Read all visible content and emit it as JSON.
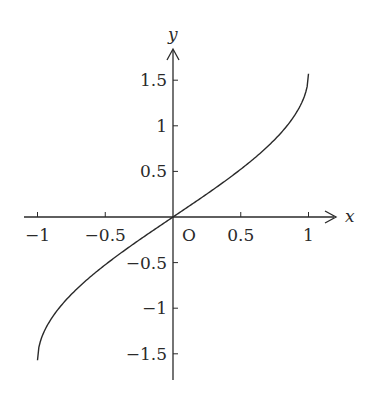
{
  "chart_data": {
    "type": "line",
    "title": "",
    "function": "y = arcsin(x)",
    "xlabel": "x",
    "ylabel": "y",
    "origin_label": "O",
    "xlim": [
      -1.1,
      1.2
    ],
    "ylim": [
      -1.8,
      1.8
    ],
    "grid": false,
    "legend": null,
    "x_ticks": [
      -1,
      -0.5,
      0.5,
      1
    ],
    "x_tick_labels": [
      "−1",
      "−0.5",
      "0.5",
      "1"
    ],
    "y_ticks": [
      1.5,
      1,
      0.5,
      -0.5,
      -1,
      -1.5
    ],
    "y_tick_labels": [
      "1.5",
      "1",
      "0.5",
      "−0.5",
      "−1",
      "−1.5"
    ],
    "series": [
      {
        "name": "arcsin(x)",
        "color": "#2a2a2a",
        "x": [
          -1,
          -0.9,
          -0.75,
          -0.5,
          -0.25,
          0,
          0.25,
          0.5,
          0.75,
          0.9,
          1
        ],
        "y": [
          -1.571,
          -1.12,
          -0.848,
          -0.524,
          -0.253,
          0,
          0.253,
          0.524,
          0.848,
          1.12,
          1.571
        ]
      }
    ]
  }
}
